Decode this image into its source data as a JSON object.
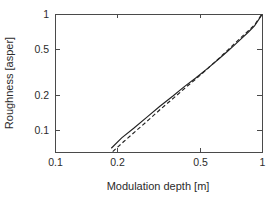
{
  "chart_data": {
    "type": "line",
    "title": "",
    "xlabel": "Modulation depth [m]",
    "ylabel": "Roughness [asper]",
    "xscale": "log",
    "yscale": "log",
    "xlim": [
      0.1,
      1.0
    ],
    "ylim": [
      0.065,
      1.0
    ],
    "grid": false,
    "legend": "none",
    "xticks": [
      0.1,
      0.2,
      0.5,
      1
    ],
    "xtick_labels": [
      "0.1",
      "0.2",
      "0.5",
      "1"
    ],
    "yticks": [
      0.1,
      0.2,
      0.5,
      1
    ],
    "ytick_labels": [
      "0.1",
      "0.2",
      "0.5",
      "1"
    ],
    "series": [
      {
        "name": "solid-curve",
        "style": "solid",
        "color": "#222222",
        "x": [
          0.187,
          0.21,
          0.24,
          0.28,
          0.32,
          0.37,
          0.42,
          0.48,
          0.55,
          0.62,
          0.68,
          0.74,
          0.8,
          0.86,
          0.92,
          1.0
        ],
        "y": [
          0.07,
          0.086,
          0.104,
          0.131,
          0.16,
          0.196,
          0.236,
          0.283,
          0.344,
          0.412,
          0.476,
          0.546,
          0.62,
          0.7,
          0.79,
          0.985
        ]
      },
      {
        "name": "dashed-curve",
        "style": "dashed",
        "color": "#222222",
        "x": [
          0.19,
          0.215,
          0.245,
          0.285,
          0.325,
          0.375,
          0.425,
          0.485,
          0.555,
          0.625,
          0.685,
          0.745,
          0.805,
          0.865,
          0.925,
          1.0
        ],
        "y": [
          0.0655,
          0.08,
          0.098,
          0.124,
          0.153,
          0.19,
          0.231,
          0.281,
          0.348,
          0.421,
          0.492,
          0.566,
          0.645,
          0.725,
          0.815,
          1.0
        ]
      }
    ]
  }
}
